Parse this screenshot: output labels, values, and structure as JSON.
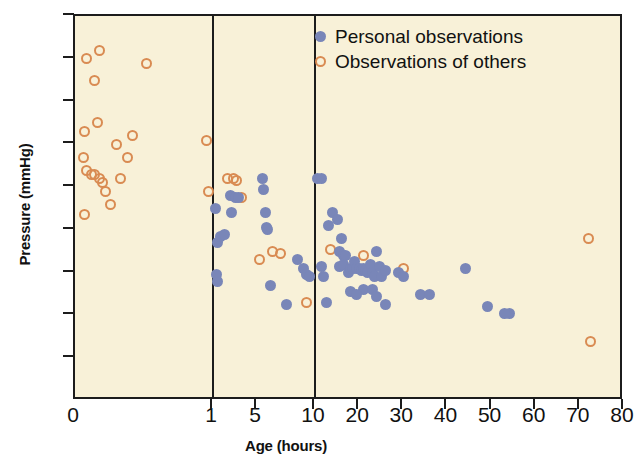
{
  "chart_data": {
    "type": "scatter",
    "title": "",
    "xlabel": "Age (hours)",
    "ylabel": "Pressure (mmHg)",
    "xticks": [
      0,
      1,
      5,
      10,
      20,
      30,
      40,
      50,
      60,
      70,
      80
    ],
    "xtick_labels": [
      "0",
      "1",
      "5",
      "10",
      "20",
      "30",
      "40",
      "50",
      "60",
      "70",
      "80"
    ],
    "yticks": [
      10,
      20,
      30,
      40,
      50,
      60,
      70,
      80,
      90
    ],
    "ytick_labels": [
      "10",
      "20",
      "30",
      "40",
      "50",
      "60",
      "70",
      "80",
      "90"
    ],
    "ylim": [
      0,
      90
    ],
    "xlim": [
      0,
      80
    ],
    "grid": false,
    "x_scale_note": "piecewise: 0-1 and 1-10 compressed segments, 10-80 linear",
    "divider_lines_x": [
      1,
      10
    ],
    "legend_position": "top-right",
    "colors": {
      "personal": "#7986b8",
      "others": "#d98b52",
      "plot_background": "#f8f1d8",
      "axis": "#1c1c1c",
      "text": "#111111"
    },
    "series": [
      {
        "name": "Personal observations",
        "marker": "filled-circle",
        "color": "#7986b8",
        "points": [
          [
            1.25,
            45
          ],
          [
            1.45,
            37
          ],
          [
            1.7,
            38.5
          ],
          [
            2.0,
            39
          ],
          [
            1.35,
            29.5
          ],
          [
            1.4,
            28
          ],
          [
            2.6,
            48
          ],
          [
            3.0,
            47.5
          ],
          [
            3.3,
            47.5
          ],
          [
            2.7,
            44
          ],
          [
            5.5,
            52
          ],
          [
            5.6,
            49.5
          ],
          [
            5.7,
            44
          ],
          [
            5.8,
            40.5
          ],
          [
            5.9,
            40
          ],
          [
            6.2,
            27
          ],
          [
            8.5,
            33
          ],
          [
            9.0,
            31
          ],
          [
            9.3,
            29.5
          ],
          [
            9.5,
            29
          ],
          [
            7.5,
            22.5
          ],
          [
            10.5,
            52
          ],
          [
            11.5,
            52
          ],
          [
            13,
            41
          ],
          [
            11.5,
            31.5
          ],
          [
            12,
            29
          ],
          [
            12.5,
            23
          ],
          [
            14,
            44
          ],
          [
            15,
            42.5
          ],
          [
            15.5,
            35
          ],
          [
            16,
            38
          ],
          [
            16.5,
            34
          ],
          [
            16.8,
            34
          ],
          [
            15.5,
            31.5
          ],
          [
            16.5,
            32
          ],
          [
            17.5,
            30
          ],
          [
            18,
            31
          ],
          [
            18.5,
            31
          ],
          [
            19,
            32.5
          ],
          [
            19.5,
            31
          ],
          [
            20,
            31
          ],
          [
            20.5,
            30.5
          ],
          [
            21,
            31
          ],
          [
            21.5,
            30.5
          ],
          [
            22,
            30
          ],
          [
            22.5,
            32
          ],
          [
            23,
            30
          ],
          [
            23.5,
            29
          ],
          [
            24,
            35
          ],
          [
            24.5,
            31.5
          ],
          [
            25,
            29
          ],
          [
            26,
            30.5
          ],
          [
            21,
            26
          ],
          [
            23,
            26
          ],
          [
            18,
            25.5
          ],
          [
            19.5,
            25
          ],
          [
            24,
            24.5
          ],
          [
            26,
            22.5
          ],
          [
            29,
            30
          ],
          [
            30,
            29
          ],
          [
            34,
            25
          ],
          [
            36,
            25
          ],
          [
            44,
            31
          ],
          [
            49,
            22
          ],
          [
            54,
            20.5
          ],
          [
            53,
            20.5
          ]
        ]
      },
      {
        "name": "Observations of others",
        "marker": "open-circle",
        "color": "#d98b52",
        "points": [
          [
            0.08,
            80
          ],
          [
            0.18,
            82
          ],
          [
            0.14,
            75
          ],
          [
            0.52,
            79
          ],
          [
            0.07,
            63
          ],
          [
            0.16,
            65
          ],
          [
            0.3,
            60
          ],
          [
            0.42,
            62
          ],
          [
            0.38,
            57
          ],
          [
            0.06,
            57
          ],
          [
            0.08,
            54
          ],
          [
            0.12,
            53
          ],
          [
            0.14,
            53
          ],
          [
            0.18,
            52
          ],
          [
            0.2,
            51
          ],
          [
            0.22,
            49
          ],
          [
            0.33,
            52
          ],
          [
            0.26,
            46
          ],
          [
            0.07,
            43.5
          ],
          [
            0.95,
            61
          ],
          [
            0.97,
            49
          ],
          [
            2.3,
            52
          ],
          [
            2.9,
            52
          ],
          [
            3.1,
            51.5
          ],
          [
            3.6,
            47.5
          ],
          [
            5.2,
            33
          ],
          [
            6.3,
            35
          ],
          [
            7.0,
            34.5
          ],
          [
            9.3,
            23
          ],
          [
            13.5,
            35.5
          ],
          [
            21,
            34
          ],
          [
            30,
            31
          ],
          [
            72,
            38
          ],
          [
            72.5,
            14
          ]
        ]
      }
    ]
  },
  "legend": {
    "items": [
      {
        "label": "Personal observations",
        "marker": "filled-circle"
      },
      {
        "label": "Observations of others",
        "marker": "open-circle"
      }
    ]
  }
}
